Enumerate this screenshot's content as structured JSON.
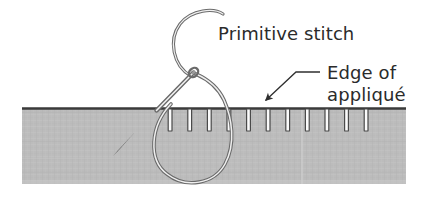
{
  "figure": {
    "title_label": "Primitive stitch",
    "edge_label_line1": "Edge of",
    "edge_label_line2": "appliqué",
    "colors": {
      "background": "#ffffff",
      "fabric_fill": "#bcbcbc",
      "fabric_edge_line": "#3a3a3a",
      "stitch_fill": "#fbfbfb",
      "stitch_stroke": "#4a4a4a",
      "thread_stroke": "#6e6e6e",
      "thread_highlight": "#f4f4f4",
      "needle_fill": "#3d3d3d",
      "text": "#2b2b2b",
      "leader_line": "#2f2f2f",
      "seam_line": "#cfcfcf"
    },
    "fabric": {
      "left": 22,
      "right": 406,
      "top": 108,
      "bottom": 184,
      "seam_x": 302
    },
    "stitches": {
      "count": 11,
      "first_x": 170,
      "spacing": 19.6,
      "width": 4,
      "height": 22,
      "x_positions": [
        170,
        189.6,
        209.2,
        228.8,
        248.4,
        268,
        287.6,
        307.2,
        326.8,
        346.4,
        366
      ]
    },
    "annotations": {
      "leader_horizontal": {
        "x1": 320,
        "y1": 72,
        "x2": 296,
        "y2": 72
      },
      "leader_diagonal": {
        "x1": 296,
        "y1": 72,
        "x2": 264,
        "y2": 101
      },
      "arrowhead_tip": {
        "x": 261,
        "y": 104
      }
    },
    "title_position": {
      "x": 218,
      "y": 40
    },
    "edge_label_position": {
      "x": 327,
      "y": 79
    },
    "edge_label_line2_position": {
      "x": 327,
      "y": 101
    }
  }
}
